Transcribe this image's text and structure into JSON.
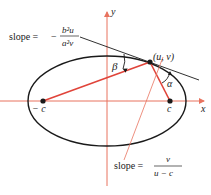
{
  "diagram": {
    "axes": {
      "x_label": "x",
      "y_label": "y",
      "color": "#e8735f"
    },
    "ellipse": {
      "color": "#1a1a1a"
    },
    "foci": [
      {
        "label": "− c"
      },
      {
        "label": "c"
      }
    ],
    "point": {
      "label": "(u, v)"
    },
    "angles": {
      "beta": "β",
      "alpha": "α"
    },
    "tangent_slope": {
      "prefix": "slope =",
      "sign": "−",
      "numerator": "b²u",
      "denominator": "a²v"
    },
    "normal_slope": {
      "prefix": "slope =",
      "numerator": "v",
      "denominator": "u − c"
    },
    "colors": {
      "red": "#e0443a",
      "thin_red": "#e8735f",
      "black": "#1a1a1a"
    }
  }
}
